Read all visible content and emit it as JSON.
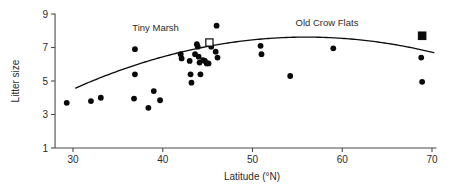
{
  "chart_data": {
    "type": "scatter",
    "title": "",
    "xlabel": "Latitude (°N)",
    "ylabel": "Litter size",
    "xlim": [
      28.0,
      70.5
    ],
    "ylim": [
      1,
      9
    ],
    "xticks": [
      30,
      40,
      50,
      60,
      70
    ],
    "xtick_labels": [
      "30",
      "40",
      "50",
      "60",
      "70"
    ],
    "yticks": [
      1,
      3,
      5,
      7,
      9
    ],
    "ytick_labels": [
      "1",
      "3",
      "5",
      "7",
      "9"
    ],
    "grid": false,
    "legend": "none",
    "series": [
      {
        "name": "Populations",
        "marker": "filled-circle",
        "points": [
          [
            29.3,
            3.7
          ],
          [
            32.0,
            3.8
          ],
          [
            33.1,
            4.0
          ],
          [
            36.9,
            6.9
          ],
          [
            36.9,
            5.4
          ],
          [
            36.8,
            3.95
          ],
          [
            38.4,
            3.4
          ],
          [
            39.0,
            4.4
          ],
          [
            39.7,
            3.85
          ],
          [
            42.0,
            6.6
          ],
          [
            42.1,
            6.35
          ],
          [
            43.0,
            6.2
          ],
          [
            43.1,
            5.4
          ],
          [
            43.2,
            4.9
          ],
          [
            43.6,
            6.6
          ],
          [
            43.8,
            7.2
          ],
          [
            43.9,
            7.05
          ],
          [
            44.0,
            6.45
          ],
          [
            44.1,
            6.1
          ],
          [
            44.2,
            5.4
          ],
          [
            44.5,
            6.25
          ],
          [
            44.7,
            6.2
          ],
          [
            44.9,
            6.05
          ],
          [
            45.1,
            6.05
          ],
          [
            45.4,
            7.05
          ],
          [
            45.9,
            6.75
          ],
          [
            46.0,
            8.3
          ],
          [
            46.1,
            6.4
          ],
          [
            50.9,
            7.1
          ],
          [
            51.0,
            6.6
          ],
          [
            54.2,
            5.3
          ],
          [
            59.0,
            6.95
          ],
          [
            68.8,
            6.4
          ],
          [
            68.9,
            4.95
          ]
        ]
      },
      {
        "name": "Tiny Marsh",
        "marker": "open-square",
        "points": [
          [
            45.2,
            7.3
          ]
        ]
      },
      {
        "name": "Old Crow Flats",
        "marker": "filled-square",
        "points": [
          [
            68.9,
            7.7
          ]
        ]
      }
    ],
    "fit_curve": {
      "type": "quadratic",
      "description": "fitted regression curve peaking near latitude 56",
      "vertex": [
        56.0,
        7.62
      ],
      "curvature": -0.0046,
      "x_range": [
        30.3,
        70.2
      ]
    },
    "annotations": [
      {
        "text": "Tiny Marsh",
        "x": 45.2,
        "y": 7.3,
        "label_at": [
          39.2,
          8.0
        ]
      },
      {
        "text": "Old Crow Flats",
        "x": 68.9,
        "y": 7.7,
        "label_at": [
          58.3,
          8.3
        ]
      }
    ]
  }
}
